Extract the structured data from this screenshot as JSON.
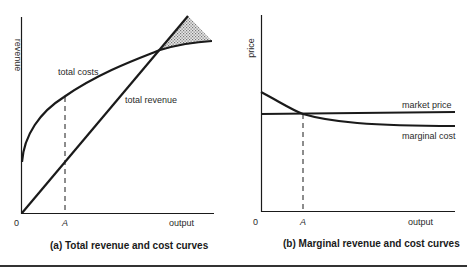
{
  "panels": {
    "a": {
      "caption": "(a)  Total revenue and cost curves",
      "y_axis_label": "revenue",
      "x_axis_label": "output",
      "origin_label": "0",
      "tick_label": "A",
      "curves": {
        "total_costs": "total costs",
        "total_revenue": "total revenue"
      }
    },
    "b": {
      "caption": "(b)  Marginal revenue and cost curves",
      "y_axis_label": "price",
      "x_axis_label": "output",
      "origin_label": "0",
      "tick_label": "A",
      "curves": {
        "market_price": "market price",
        "marginal_cost": "marginal cost"
      }
    }
  },
  "colors": {
    "line": "#1a1a1a",
    "shade": "#9a9a9a",
    "background": "#ffffff"
  }
}
